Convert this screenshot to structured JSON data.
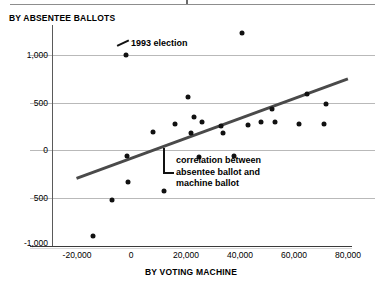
{
  "chart_data": {
    "type": "scatter",
    "title": "",
    "ylabel": "BY ABSENTEE BALLOTS",
    "xlabel": "BY VOTING MACHINE",
    "xlim": [
      -25000,
      85000
    ],
    "ylim": [
      -1150,
      1300
    ],
    "grid": true,
    "legend_position": "none",
    "xticks": [
      {
        "value": -20000,
        "label": "-20,000"
      },
      {
        "value": 0,
        "label": "0"
      },
      {
        "value": 20000,
        "label": "20,000"
      },
      {
        "value": 40000,
        "label": "40,000"
      },
      {
        "value": 60000,
        "label": "60,000"
      },
      {
        "value": 80000,
        "label": "80,000"
      }
    ],
    "yticks": [
      {
        "value": 1000,
        "label": "1,000"
      },
      {
        "value": 500,
        "label": "500"
      },
      {
        "value": 0,
        "label": "0"
      },
      {
        "value": -500,
        "label": "500"
      },
      {
        "value": -1000,
        "label": "-1,000"
      }
    ],
    "points": [
      {
        "x": -14000,
        "y": -900
      },
      {
        "x": -7000,
        "y": -520
      },
      {
        "x": -2000,
        "y": 1000
      },
      {
        "x": -1500,
        "y": -60
      },
      {
        "x": -1000,
        "y": -330
      },
      {
        "x": 8000,
        "y": 190
      },
      {
        "x": 12000,
        "y": -420
      },
      {
        "x": 16000,
        "y": 280
      },
      {
        "x": 21000,
        "y": 560
      },
      {
        "x": 22000,
        "y": 180
      },
      {
        "x": 23000,
        "y": 350
      },
      {
        "x": 25000,
        "y": -70
      },
      {
        "x": 26000,
        "y": 300
      },
      {
        "x": 33000,
        "y": 255
      },
      {
        "x": 34000,
        "y": 185
      },
      {
        "x": 38000,
        "y": -60
      },
      {
        "x": 41000,
        "y": 1230
      },
      {
        "x": 43000,
        "y": 270
      },
      {
        "x": 48000,
        "y": 300
      },
      {
        "x": 52000,
        "y": 430
      },
      {
        "x": 53000,
        "y": 300
      },
      {
        "x": 62000,
        "y": 280
      },
      {
        "x": 65000,
        "y": 590
      },
      {
        "x": 71000,
        "y": 280
      },
      {
        "x": 72000,
        "y": 490
      }
    ],
    "trendline": {
      "x_start": -20500,
      "y_start": -280,
      "x_end": 79500,
      "y_end": 760
    },
    "annotations": [
      {
        "id": "election-1993",
        "text": "1993 election",
        "points_to_x": -2000,
        "points_to_y": 1000
      },
      {
        "id": "correlation-note",
        "lines": [
          "correlation between",
          "absentee ballot and",
          "machine ballot"
        ],
        "points_to_x": 13000,
        "points_to_y": 20
      }
    ]
  }
}
